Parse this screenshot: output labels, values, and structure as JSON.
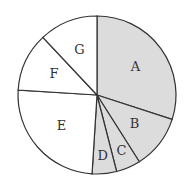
{
  "chart_data": {
    "type": "pie",
    "title": "",
    "categories": [
      "A",
      "B",
      "C",
      "D",
      "E",
      "F",
      "G"
    ],
    "values": [
      30,
      11,
      5,
      5,
      25,
      12,
      12
    ],
    "start_angle_deg": 0,
    "direction": "clockwise",
    "shaded": [
      true,
      true,
      true,
      true,
      false,
      false,
      false
    ],
    "colors": {
      "shaded": "#dcdcdc",
      "unshaded": "#ffffff",
      "stroke": "#333333"
    }
  }
}
